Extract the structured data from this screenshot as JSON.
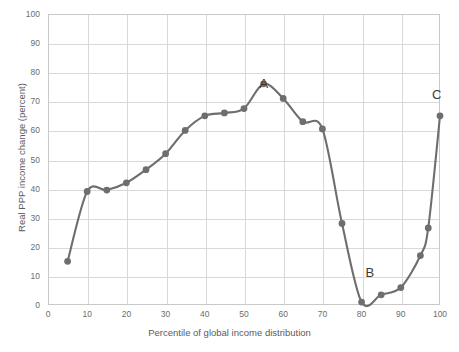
{
  "chart_data": {
    "type": "line",
    "title": "",
    "xlabel": "Percentile of global income distribution",
    "ylabel": "Real PPP income change (percent)",
    "xlim": [
      0,
      100
    ],
    "ylim": [
      0,
      100
    ],
    "xticks": [
      0,
      10,
      20,
      30,
      40,
      50,
      60,
      70,
      80,
      90,
      100
    ],
    "yticks": [
      0,
      10,
      20,
      30,
      40,
      50,
      60,
      70,
      80,
      90,
      100
    ],
    "grid": true,
    "legend": "none",
    "series": [
      {
        "name": "Real PPP income change",
        "color": "#6e6e6e",
        "marker": "circle",
        "x": [
          5,
          10,
          15,
          20,
          25,
          30,
          35,
          40,
          45,
          50,
          55,
          60,
          65,
          70,
          75,
          80,
          85,
          90,
          95,
          97,
          100
        ],
        "values": [
          15,
          39,
          39.5,
          42,
          46.5,
          52,
          60,
          65,
          66,
          67.5,
          76,
          71,
          63,
          60.5,
          28,
          1,
          3.5,
          6,
          17,
          26.5,
          65
        ]
      }
    ],
    "annotations": [
      {
        "label": "A",
        "x": 55,
        "y": 76,
        "note": "peak of emerging-middle-class gains"
      },
      {
        "label": "B",
        "x": 82,
        "y": 11,
        "note": "trough, developed-world lower-middle class"
      },
      {
        "label": "C",
        "x": 99,
        "y": 72,
        "note": "global top 1 percent"
      }
    ]
  },
  "axes": {
    "y_tick_labels": [
      "0",
      "10",
      "20",
      "30",
      "40",
      "50",
      "60",
      "70",
      "80",
      "90",
      "100"
    ],
    "x_tick_labels": [
      "0",
      "10",
      "20",
      "30",
      "40",
      "50",
      "60",
      "70",
      "80",
      "90",
      "100"
    ],
    "x_axis_title": "Percentile of global income distribution",
    "y_axis_title": "Real PPP income change (percent)"
  },
  "style": {
    "line_color": "#6e6e6e",
    "marker_color": "#6e6e6e",
    "grid_color": "#d9d9d9",
    "frame_color": "#c9c9c9",
    "tick_label_color": "#6d6d6d",
    "axis_title_color": "#5b5b5b",
    "annotation_color": "#3a3a3a",
    "background": "#ffffff"
  }
}
